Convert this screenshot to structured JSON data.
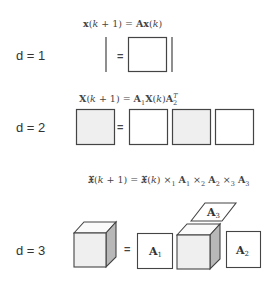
{
  "rows": [
    {
      "label": "d = 1",
      "equation": {
        "lhs": "x(k + 1)",
        "rhs": "Ax(k)",
        "text": "x(k + 1) = Ax(k)"
      }
    },
    {
      "label": "d = 2",
      "equation": {
        "text": "X(k + 1) = A1 X(k) A2^T"
      }
    },
    {
      "label": "d = 3",
      "equation": {
        "text": "𝔛(k + 1) = 𝔛(k) ×1 A1 ×2 A2 ×3 A3"
      },
      "matrix_labels": [
        "A1",
        "A2",
        "A3"
      ]
    }
  ],
  "equals_sign": "=",
  "colors": {
    "stroke": "#444444",
    "tensor_fill": "#efefef",
    "side_fill": "#b8b8b8",
    "top_fill": "#fafafa",
    "white": "#ffffff"
  }
}
